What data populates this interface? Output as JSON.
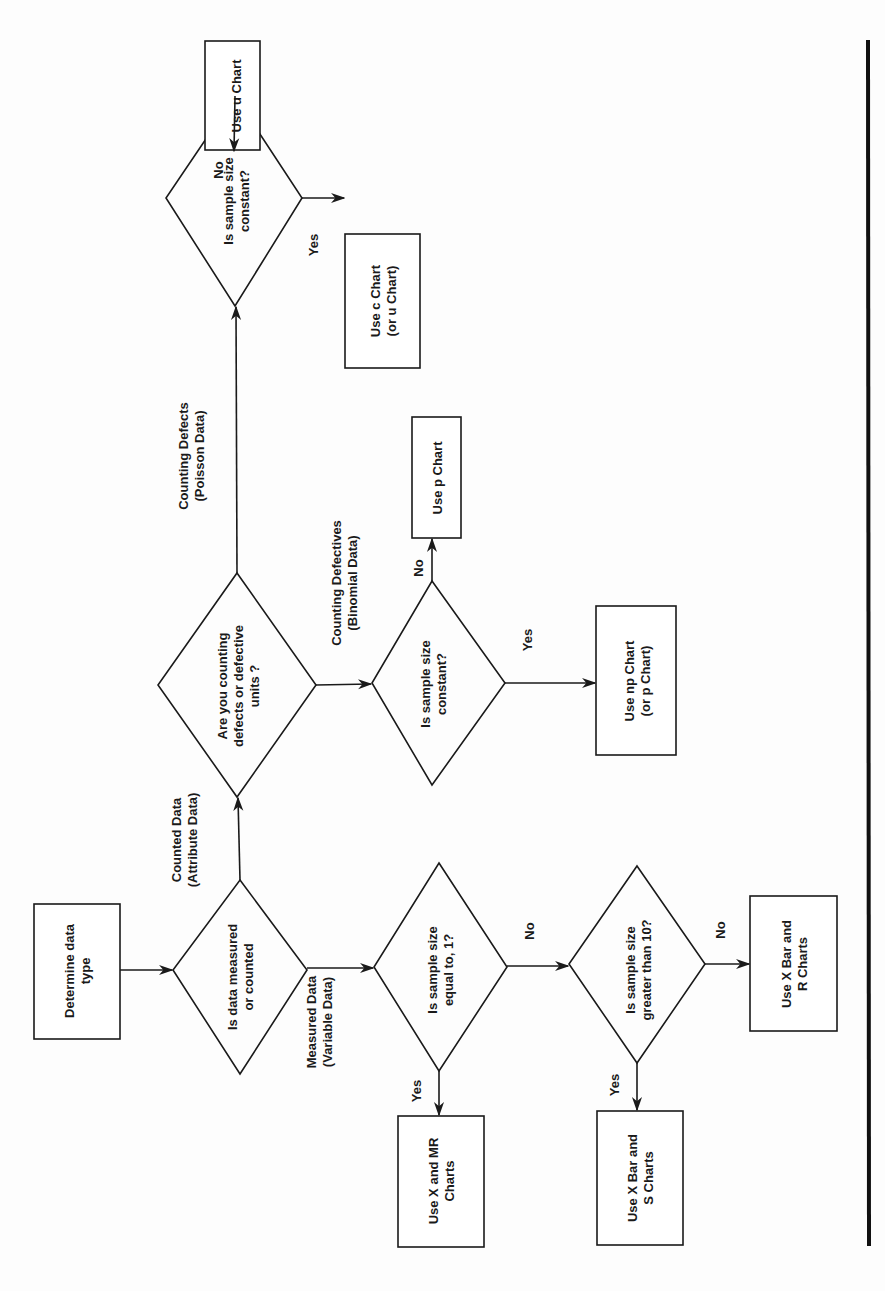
{
  "diagram": {
    "type": "flowchart",
    "orientation": "rotated 90 degrees counterclockwise",
    "start": {
      "id": "start",
      "lines": [
        "Determine data",
        "type"
      ]
    },
    "decisions": [
      {
        "id": "d_measured",
        "lines": [
          "Is data measured",
          "or counted"
        ]
      },
      {
        "id": "d_defects",
        "lines": [
          "Are you counting",
          "defects or defective",
          "units ?"
        ]
      },
      {
        "id": "d_poisson_const",
        "lines": [
          "Is sample size",
          "constant?"
        ]
      },
      {
        "id": "d_binom_const",
        "lines": [
          "Is sample size",
          "constant?"
        ]
      },
      {
        "id": "d_equal1",
        "lines": [
          "Is sample size",
          "equal to, 1?"
        ]
      },
      {
        "id": "d_gt10",
        "lines": [
          "Is sample size",
          "greater than 10?"
        ]
      }
    ],
    "outcomes": [
      {
        "id": "o_u",
        "lines": [
          "Use u Chart"
        ]
      },
      {
        "id": "o_c",
        "lines": [
          "Use c Chart",
          "(or u Chart)"
        ]
      },
      {
        "id": "o_p",
        "lines": [
          "Use p Chart"
        ]
      },
      {
        "id": "o_np",
        "lines": [
          "Use np Chart",
          "(or p Chart)"
        ]
      },
      {
        "id": "o_xmr",
        "lines": [
          "Use X and MR",
          "Charts"
        ]
      },
      {
        "id": "o_xs",
        "lines": [
          "Use X Bar and",
          "S Charts"
        ]
      },
      {
        "id": "o_xr",
        "lines": [
          "Use X Bar and",
          "R Charts"
        ]
      }
    ],
    "edge_labels": {
      "counted": [
        "Counted Data",
        "(Attribute Data)"
      ],
      "measured": [
        "Measured Data",
        "(Variable Data)"
      ],
      "defects": [
        "Counting Defects",
        "(Poisson Data)"
      ],
      "defectives": [
        "Counting Defectives",
        "(Binomial Data)"
      ],
      "yes": "Yes",
      "no": "No"
    },
    "edges": [
      {
        "from": "start",
        "to": "d_measured"
      },
      {
        "from": "d_measured",
        "to": "d_defects",
        "label": "Counted Data (Attribute Data)"
      },
      {
        "from": "d_measured",
        "to": "d_equal1",
        "label": "Measured Data (Variable Data)"
      },
      {
        "from": "d_defects",
        "to": "d_poisson_const",
        "label": "Counting Defects (Poisson Data)"
      },
      {
        "from": "d_defects",
        "to": "d_binom_const",
        "label": "Counting Defectives (Binomial Data)"
      },
      {
        "from": "d_poisson_const",
        "to": "o_u",
        "label": "No"
      },
      {
        "from": "d_poisson_const",
        "to": "o_c",
        "label": "Yes"
      },
      {
        "from": "d_binom_const",
        "to": "o_p",
        "label": "No"
      },
      {
        "from": "d_binom_const",
        "to": "o_np",
        "label": "Yes"
      },
      {
        "from": "d_equal1",
        "to": "o_xmr",
        "label": "Yes"
      },
      {
        "from": "d_equal1",
        "to": "d_gt10",
        "label": "No"
      },
      {
        "from": "d_gt10",
        "to": "o_xs",
        "label": "Yes"
      },
      {
        "from": "d_gt10",
        "to": "o_xr",
        "label": "No"
      }
    ]
  }
}
